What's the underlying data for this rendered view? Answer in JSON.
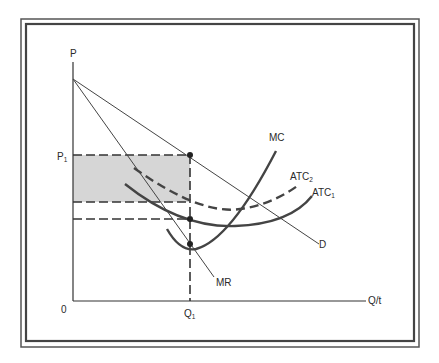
{
  "diagram": {
    "type": "monopoly_cost_revenue_diagram",
    "axes": {
      "y_label": "P",
      "x_label": "Q/t",
      "origin_label": "0"
    },
    "price_label": {
      "main": "P",
      "sub": "1"
    },
    "quantity_label": {
      "main": "Q",
      "sub": "1"
    },
    "curves": {
      "demand": "D",
      "marginal_revenue": "MR",
      "marginal_cost": "MC",
      "atc1": {
        "main": "ATC",
        "sub": "1"
      },
      "atc2": {
        "main": "ATC",
        "sub": "2"
      }
    },
    "shaded_region": "profit area between P1 and ATC2 at Q1",
    "colors": {
      "line": "#3a3a3a",
      "shade": "#d4d4d4",
      "frame": "#4a4a4a",
      "background": "#ffffff"
    }
  }
}
